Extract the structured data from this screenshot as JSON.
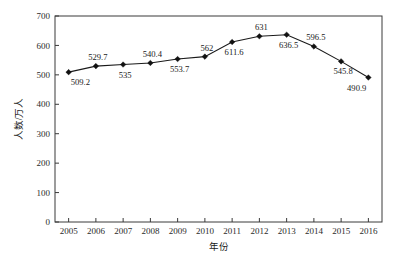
{
  "chart_data": {
    "type": "line",
    "title": "",
    "subtitle": "",
    "xlabel": "年份",
    "ylabel": "人数/万人",
    "categories": [
      "2005",
      "2006",
      "2007",
      "2008",
      "2009",
      "2010",
      "2011",
      "2012",
      "2013",
      "2014",
      "2015",
      "2016"
    ],
    "values": [
      509.2,
      529.7,
      535,
      540.4,
      553.7,
      562,
      611.6,
      631,
      636.5,
      596.5,
      545.8,
      490.9
    ],
    "point_labels": [
      "509.2",
      "529.7",
      "535",
      "540.4",
      "553.7",
      "562",
      "611.6",
      "631",
      "636.5",
      "596.5",
      "545.8",
      "490.9"
    ],
    "label_positions": [
      "below",
      "above",
      "below",
      "above",
      "below",
      "above",
      "below",
      "above",
      "below",
      "above",
      "below",
      "below"
    ],
    "ylim": [
      0,
      700
    ],
    "yticks": [
      0,
      100,
      200,
      300,
      400,
      500,
      600,
      700
    ],
    "ytick_labels": [
      "0",
      "100",
      "200",
      "300",
      "400",
      "500",
      "600",
      "700"
    ],
    "grid": false,
    "legend": null,
    "legend_position": "none",
    "marker": "diamond",
    "line_color": "#1a1a1a",
    "marker_color": "#111111",
    "axis_color": "#3a3a3a",
    "background": "#ffffff"
  }
}
